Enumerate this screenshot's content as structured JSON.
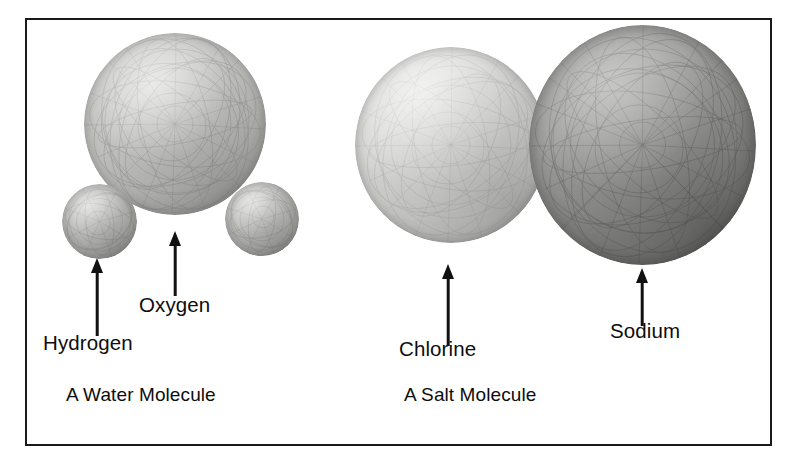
{
  "figure": {
    "border_color": "#1a1a1a",
    "background_color": "#ffffff"
  },
  "molecules": [
    {
      "caption": "A Water Molecule",
      "atoms": [
        {
          "label": "Hydrogen",
          "shade": "#b8b8b6",
          "relative_size": "small"
        },
        {
          "label": "Oxygen",
          "shade": "#c4c4c2",
          "relative_size": "large"
        }
      ]
    },
    {
      "caption": "A Salt Molecule",
      "atoms": [
        {
          "label": "Chlorine",
          "shade": "#d5d5d3",
          "relative_size": "large"
        },
        {
          "label": "Sodium",
          "shade": "#999997",
          "relative_size": "largest"
        }
      ]
    }
  ],
  "labels": {
    "hydrogen": "Hydrogen",
    "oxygen": "Oxygen",
    "chlorine": "Chlorine",
    "sodium": "Sodium"
  },
  "captions": {
    "water": "A Water Molecule",
    "salt": "A Salt Molecule"
  }
}
